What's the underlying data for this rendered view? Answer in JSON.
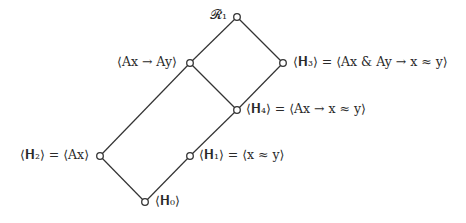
{
  "diagram": {
    "type": "lattice",
    "nodes": [
      {
        "id": "R1",
        "label": "𝓡₁",
        "x": 237,
        "y": 17
      },
      {
        "id": "AxAy",
        "label": "⟨Ax → Ay⟩",
        "x": 190,
        "y": 63
      },
      {
        "id": "H3",
        "label": "⟨𝐇₃⟩ = ⟨Ax & Ay → x ≈ y⟩",
        "x": 283,
        "y": 63
      },
      {
        "id": "H4",
        "label": "⟨𝐇₄⟩ = ⟨Ax → x ≈ y⟩",
        "x": 237,
        "y": 110
      },
      {
        "id": "H2",
        "label": "⟨𝐇₂⟩ = ⟨Ax⟩",
        "x": 100,
        "y": 156
      },
      {
        "id": "H1",
        "label": "⟨𝐇₁⟩ = ⟨x ≈ y⟩",
        "x": 190,
        "y": 156
      },
      {
        "id": "H0",
        "label": "⟨𝐇₀⟩",
        "x": 145,
        "y": 202
      }
    ],
    "edges": [
      [
        "R1",
        "AxAy"
      ],
      [
        "R1",
        "H3"
      ],
      [
        "AxAy",
        "H4"
      ],
      [
        "H3",
        "H4"
      ],
      [
        "AxAy",
        "H2"
      ],
      [
        "H4",
        "H1"
      ],
      [
        "H2",
        "H0"
      ],
      [
        "H1",
        "H0"
      ]
    ],
    "line_color": "#333333",
    "node_fill": "#ffffff"
  }
}
